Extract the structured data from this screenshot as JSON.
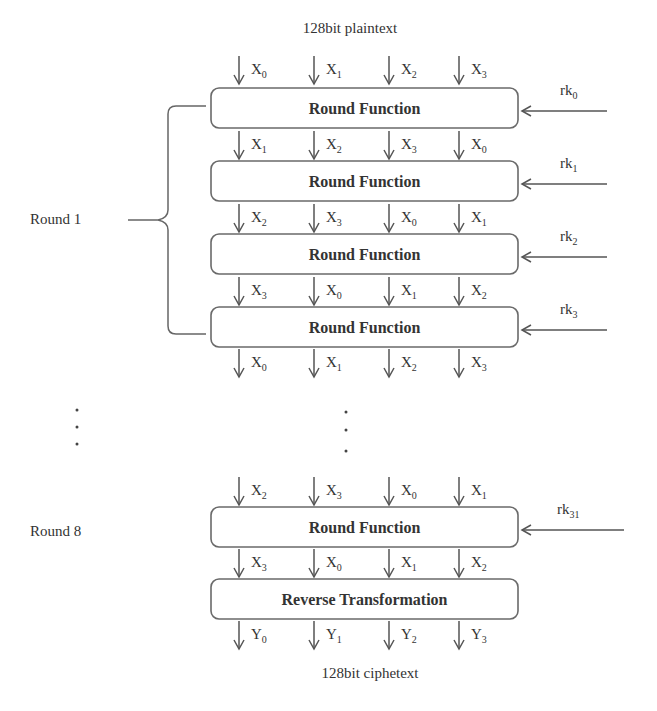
{
  "title_top": "128bit plaintext",
  "title_bottom": "128bit ciphetext",
  "round_labels": [
    {
      "text": "Round 1",
      "x": 30,
      "y": 224
    },
    {
      "text": "Round 8",
      "x": 30,
      "y": 536
    }
  ],
  "column_x": [
    239,
    314,
    389,
    459
  ],
  "box": {
    "x": 211,
    "width": 307,
    "height": 40,
    "radius": 8
  },
  "blocks": [
    {
      "label": "Round Function",
      "y": 88,
      "key": "rk",
      "key_sub": "0",
      "inputs": [
        [
          "X",
          "0"
        ],
        [
          "X",
          "1"
        ],
        [
          "X",
          "2"
        ],
        [
          "X",
          "3"
        ]
      ],
      "input_y": 56
    },
    {
      "label": "Round Function",
      "y": 161,
      "key": "rk",
      "key_sub": "1",
      "inputs": [
        [
          "X",
          "1"
        ],
        [
          "X",
          "2"
        ],
        [
          "X",
          "3"
        ],
        [
          "X",
          "0"
        ]
      ],
      "input_y": 131
    },
    {
      "label": "Round Function",
      "y": 234,
      "key": "rk",
      "key_sub": "2",
      "inputs": [
        [
          "X",
          "2"
        ],
        [
          "X",
          "3"
        ],
        [
          "X",
          "0"
        ],
        [
          "X",
          "1"
        ]
      ],
      "input_y": 204
    },
    {
      "label": "Round Function",
      "y": 307,
      "key": "rk",
      "key_sub": "3",
      "inputs": [
        [
          "X",
          "3"
        ],
        [
          "X",
          "0"
        ],
        [
          "X",
          "1"
        ],
        [
          "X",
          "2"
        ]
      ],
      "input_y": 277
    },
    {
      "label": "Round Function",
      "y": 507,
      "key": "rk",
      "key_sub": "31",
      "inputs": [
        [
          "X",
          "2"
        ],
        [
          "X",
          "3"
        ],
        [
          "X",
          "0"
        ],
        [
          "X",
          "1"
        ]
      ],
      "input_y": 477
    },
    {
      "label": "Reverse Transformation",
      "y": 579,
      "key": null,
      "key_sub": null,
      "inputs": [
        [
          "X",
          "3"
        ],
        [
          "X",
          "0"
        ],
        [
          "X",
          "1"
        ],
        [
          "X",
          "2"
        ]
      ],
      "input_y": 549
    }
  ],
  "outputs_round1": {
    "y": 349,
    "items": [
      [
        "X",
        "0"
      ],
      [
        "X",
        "1"
      ],
      [
        "X",
        "2"
      ],
      [
        "X",
        "3"
      ]
    ]
  },
  "outputs_final": {
    "y": 621,
    "items": [
      [
        "Y",
        "0"
      ],
      [
        "Y",
        "1"
      ],
      [
        "Y",
        "2"
      ],
      [
        "Y",
        "3"
      ]
    ]
  },
  "key_arrow": {
    "from_x": 607,
    "to_x": 522
  },
  "key_arrow_last": {
    "from_x": 624,
    "to_x": 522
  },
  "ellipsis": [
    {
      "x": 77,
      "ys": [
        410,
        427,
        444
      ]
    },
    {
      "x": 346,
      "ys": [
        412,
        430,
        451
      ]
    }
  ],
  "colors": {
    "stroke": "#6a6a6a",
    "text": "#333333",
    "background": "#ffffff"
  }
}
